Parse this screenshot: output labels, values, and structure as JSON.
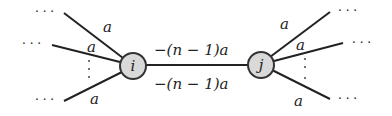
{
  "diagram": {
    "type": "graph",
    "colors": {
      "edge": "#222222",
      "node_fill": "#d9d9d9",
      "node_stroke": "#333333",
      "text": "#222222",
      "dots": "#555555"
    },
    "nodes": [
      {
        "id": "i",
        "label": "i",
        "cx": 133,
        "cy": 66,
        "r": 13
      },
      {
        "id": "j",
        "label": "j",
        "cx": 261,
        "cy": 65,
        "r": 13
      }
    ],
    "center_edge": {
      "from": "i",
      "to": "j",
      "label_top": "−(n − 1)a",
      "label_bottom": "−(n − 1)a"
    },
    "left_edges": [
      {
        "label": "a",
        "continuation": "· · ·"
      },
      {
        "label": "a",
        "continuation": "· · ·"
      },
      {
        "label": "a",
        "continuation": "· · ·"
      }
    ],
    "right_edges": [
      {
        "label": "a",
        "continuation": "· · ·"
      },
      {
        "label": "a",
        "continuation": "· · ·"
      },
      {
        "label": "a",
        "continuation": "· · ·"
      }
    ],
    "vertical_ellipsis": "⋮"
  }
}
